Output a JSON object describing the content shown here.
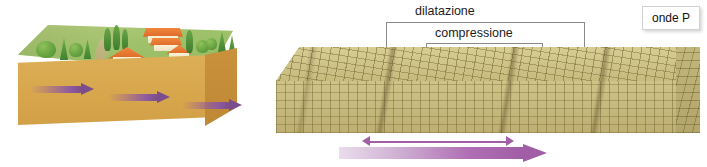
{
  "figure": {
    "title_implicit": "onde P",
    "left_panel": {
      "name": "landscape-block",
      "surface": "green hillside with trees and houses",
      "body_color": "#d8a74c",
      "surface_color": "#9ec267",
      "arrow_color": "#7c4d8c",
      "arrow_count": 3,
      "arrow_direction": "right"
    },
    "right_panel": {
      "name": "grid-block",
      "block_color": "#cfc388",
      "grid_line_color": "#766937",
      "compression_band_count": 3,
      "labels": {
        "dilatazione": "dilatazione",
        "compressione": "compressione"
      },
      "badge": "onde P",
      "arrows": {
        "thin_label": "double-headed wave span arrow",
        "thick_label": "propagation direction arrow",
        "color": "#a15ea6",
        "direction": "right"
      }
    }
  }
}
